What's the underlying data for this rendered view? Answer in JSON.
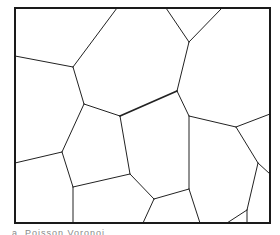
{
  "diagram": {
    "type": "voronoi-tessellation",
    "frame": {
      "x": 15,
      "y": 8,
      "width": 255,
      "height": 215,
      "stroke": "#1a1a1a",
      "stroke_width": 2
    },
    "edge_color": "#222222",
    "edges": [
      [
        117,
        8,
        73,
        67
      ],
      [
        73,
        67,
        15,
        56
      ],
      [
        73,
        67,
        84,
        104
      ],
      [
        84,
        104,
        120,
        116
      ],
      [
        120,
        116,
        177,
        91
      ],
      [
        177,
        91,
        189,
        42
      ],
      [
        189,
        42,
        166,
        8
      ],
      [
        189,
        42,
        222,
        8
      ],
      [
        177,
        91,
        189,
        116
      ],
      [
        189,
        116,
        236,
        127
      ],
      [
        236,
        127,
        270,
        114
      ],
      [
        189,
        116,
        189,
        189
      ],
      [
        189,
        189,
        200,
        223
      ],
      [
        189,
        189,
        154,
        199
      ],
      [
        236,
        127,
        258,
        163
      ],
      [
        258,
        163,
        270,
        174
      ],
      [
        258,
        163,
        247,
        210
      ],
      [
        247,
        210,
        247,
        223
      ],
      [
        247,
        210,
        227,
        223
      ],
      [
        84,
        104,
        62,
        152
      ],
      [
        62,
        152,
        15,
        163
      ],
      [
        62,
        152,
        73,
        187
      ],
      [
        73,
        187,
        73,
        223
      ],
      [
        73,
        187,
        130,
        174
      ],
      [
        120,
        116,
        130,
        174
      ],
      [
        130,
        174,
        154,
        199
      ],
      [
        154,
        199,
        143,
        223
      ]
    ],
    "thick_edges": [
      [
        120,
        116,
        177,
        91
      ]
    ]
  },
  "caption": "a. Poisson Voronoi"
}
